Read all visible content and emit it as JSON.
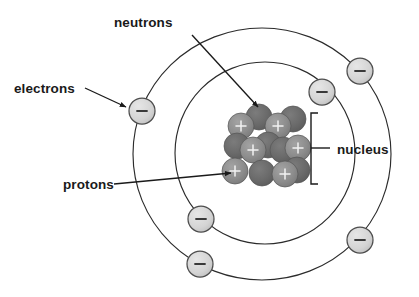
{
  "diagram": {
    "background_color": "#ffffff",
    "width": 419,
    "height": 297
  },
  "labels": {
    "neutrons": "neutrons",
    "electrons": "electrons",
    "protons": "protons",
    "nucleus": "nucleus"
  },
  "colors": {
    "proton_fill": "#8d8d8d",
    "neutron_fill": "#6a6a6a",
    "electron_fill": "#d4d4d4",
    "orbit_stroke": "#2b2b2b",
    "text": "#1a1a1a",
    "proton_sign": "#f2f2f2",
    "electron_sign": "#3a3a3a"
  },
  "structure": {
    "nucleus_center": {
      "x": 265,
      "y": 148
    },
    "orbits": [
      {
        "name": "inner-orbit",
        "cx": 265,
        "cy": 153,
        "rx": 90,
        "ry": 91
      },
      {
        "name": "outer-orbit",
        "cx": 262,
        "cy": 154,
        "rx": 129,
        "ry": 126
      }
    ],
    "electrons": [
      {
        "id": 1,
        "orbit": "inner",
        "x": 142,
        "y": 111,
        "r": 13,
        "sign": "minus"
      },
      {
        "id": 2,
        "orbit": "inner",
        "x": 322,
        "y": 92,
        "r": 13,
        "sign": "minus"
      },
      {
        "id": 3,
        "orbit": "inner",
        "x": 201,
        "y": 219,
        "r": 13,
        "sign": "minus"
      },
      {
        "id": 4,
        "orbit": "outer",
        "x": 360,
        "y": 71,
        "r": 13,
        "sign": "minus"
      },
      {
        "id": 5,
        "orbit": "outer",
        "x": 360,
        "y": 240,
        "r": 13,
        "sign": "minus"
      },
      {
        "id": 6,
        "orbit": "outer",
        "x": 200,
        "y": 264,
        "r": 13,
        "sign": "minus"
      }
    ],
    "nucleus_particles": [
      {
        "id": 1,
        "type": "neutron",
        "x": 259,
        "y": 117,
        "r": 13
      },
      {
        "id": 2,
        "type": "neutron",
        "x": 293,
        "y": 119,
        "r": 13
      },
      {
        "id": 3,
        "type": "proton",
        "x": 241,
        "y": 126,
        "r": 13
      },
      {
        "id": 4,
        "type": "proton",
        "x": 278,
        "y": 126,
        "r": 13
      },
      {
        "id": 5,
        "type": "neutron",
        "x": 237,
        "y": 146,
        "r": 13
      },
      {
        "id": 6,
        "type": "neutron",
        "x": 268,
        "y": 145,
        "r": 13
      },
      {
        "id": 7,
        "type": "proton",
        "x": 253,
        "y": 150,
        "r": 13
      },
      {
        "id": 8,
        "type": "neutron",
        "x": 283,
        "y": 150,
        "r": 13
      },
      {
        "id": 9,
        "type": "proton",
        "x": 298,
        "y": 148,
        "r": 13
      },
      {
        "id": 10,
        "type": "proton",
        "x": 235,
        "y": 171,
        "r": 13
      },
      {
        "id": 11,
        "type": "neutron",
        "x": 262,
        "y": 173,
        "r": 13
      },
      {
        "id": 12,
        "type": "proton",
        "x": 285,
        "y": 174,
        "r": 13
      },
      {
        "id": 13,
        "type": "neutron",
        "x": 297,
        "y": 170,
        "r": 13
      }
    ],
    "particle_counts": {
      "protons": 5,
      "neutrons": 8,
      "electrons": 6
    }
  },
  "annotations": {
    "neutrons_label_pos": {
      "x": 114,
      "y": 27
    },
    "electrons_label_pos": {
      "x": 14,
      "y": 93
    },
    "protons_label_pos": {
      "x": 63,
      "y": 188
    },
    "nucleus_label_pos": {
      "x": 337,
      "y": 155
    },
    "neutrons_arrow": {
      "x1": 192,
      "y1": 35,
      "x2": 259,
      "y2": 108
    },
    "electrons_arrow": {
      "x1": 85,
      "y1": 88,
      "x2": 127,
      "y2": 107
    },
    "protons_arrow": {
      "x1": 114,
      "y1": 183,
      "x2": 232,
      "y2": 173
    },
    "nucleus_bracket": {
      "x": 311,
      "y_top": 113,
      "y_bottom": 184,
      "tick_x": 325,
      "tick_y": 148
    }
  }
}
